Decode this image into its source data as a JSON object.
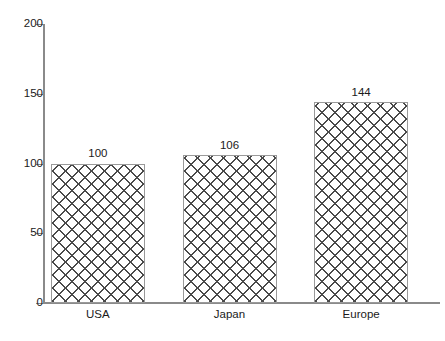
{
  "chart_data": {
    "type": "bar",
    "title": "",
    "subtitle": "",
    "xlabel": "",
    "ylabel": "",
    "categories": [
      "USA",
      "Japan",
      "Europe"
    ],
    "values": [
      100,
      106,
      144
    ],
    "data_labels": [
      "100",
      "106",
      "144"
    ],
    "ylim": [
      0,
      200
    ],
    "y_ticks": [
      200,
      150,
      100,
      50,
      0
    ],
    "y_tick_labels": [
      "200",
      "150",
      "100",
      "50",
      "0"
    ],
    "grid": false,
    "legend": null,
    "legend_position": "none",
    "orientation": "vertical",
    "bar_fill": "crosshatch",
    "colors": {
      "axis": "#8a8a8a",
      "bar_edge": "#9a9a9a",
      "hatch": "#4a4a4a",
      "bar_background": "#ffffff",
      "text": "#1a1a1a",
      "plot_background": "#ffffff"
    }
  }
}
